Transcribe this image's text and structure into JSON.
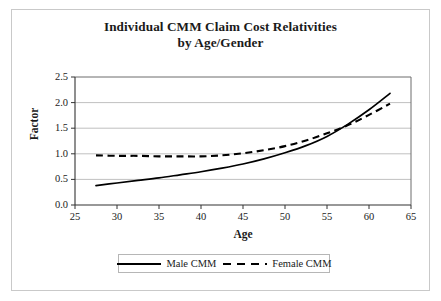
{
  "chart_data": {
    "type": "line",
    "title": "Individual CMM Claim Cost Relativities",
    "subtitle": "by Age/Gender",
    "xlabel": "Age",
    "ylabel": "Factor",
    "xlim": [
      25,
      65
    ],
    "ylim": [
      0.0,
      2.5
    ],
    "xticks": [
      "25",
      "30",
      "35",
      "40",
      "45",
      "50",
      "55",
      "60",
      "65"
    ],
    "yticks": [
      "0.0",
      "0.5",
      "1.0",
      "1.5",
      "2.0",
      "2.5"
    ],
    "grid": "horizontal",
    "legend_position": "bottom",
    "x": [
      27.5,
      30,
      32.5,
      35,
      37.5,
      40,
      42.5,
      45,
      47.5,
      50,
      52.5,
      55,
      57.5,
      60,
      62.5
    ],
    "series": [
      {
        "name": "Male CMM",
        "style": "solid",
        "color": "#000000",
        "values": [
          0.38,
          0.43,
          0.48,
          0.53,
          0.59,
          0.65,
          0.72,
          0.8,
          0.9,
          1.02,
          1.16,
          1.34,
          1.58,
          1.86,
          2.18
        ]
      },
      {
        "name": "Female CMM",
        "style": "dashed",
        "color": "#000000",
        "values": [
          0.97,
          0.96,
          0.96,
          0.95,
          0.95,
          0.95,
          0.97,
          1.01,
          1.07,
          1.15,
          1.26,
          1.4,
          1.56,
          1.76,
          1.98
        ]
      }
    ],
    "annotations": {
      "crossover_age": 56,
      "crossover_factor": 1.55
    }
  },
  "legend": {
    "items": [
      {
        "label": "Male CMM",
        "style": "solid"
      },
      {
        "label": "Female CMM",
        "style": "dashed"
      }
    ]
  }
}
